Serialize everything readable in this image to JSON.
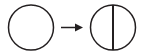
{
  "diagram": {
    "type": "transformation-sequence",
    "background_color": "#ffffff",
    "stroke_color": "#231f20",
    "caption": "",
    "elements": [
      {
        "name": "source-circle",
        "label": "circle",
        "role": "before-state",
        "shape": "circle",
        "center_x": 31,
        "center_y": 27.5,
        "radius": 22.5,
        "stroke_width": 1.5,
        "fill": "none",
        "internal_lines": []
      },
      {
        "name": "transformation-arrow",
        "label": "→",
        "role": "transforms-into",
        "shape": "arrow",
        "direction": "right",
        "shaft_start_x": 61,
        "shaft_end_x": 76,
        "shaft_y": 27.5,
        "shaft_width": 1.5,
        "head_tip_x": 83,
        "head_back_x": 75,
        "head_half_height": 4
      },
      {
        "name": "result-circle",
        "label": "bisected circle",
        "role": "after-state",
        "shape": "circle",
        "center_x": 113,
        "center_y": 27.5,
        "radius": 22.5,
        "stroke_width": 1.5,
        "fill": "none",
        "internal_lines": [
          {
            "name": "vertical-diameter",
            "label": "vertical diameter",
            "orientation": "vertical",
            "x": 113,
            "y_start": 5,
            "y_end": 50,
            "stroke_width": 2
          }
        ]
      }
    ]
  }
}
